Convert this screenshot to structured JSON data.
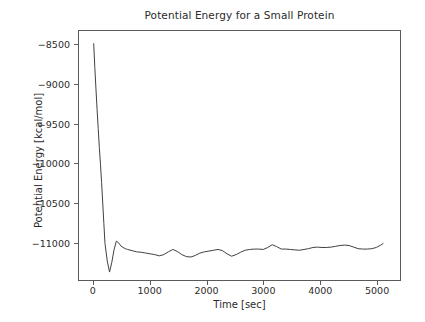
{
  "chart_data": {
    "type": "line",
    "title": "Potential Energy for a Small Protein",
    "xlabel": "Time [sec]",
    "ylabel": "Potential Energy [kcal/mol]",
    "xlim": [
      -260,
      5420
    ],
    "ylim": [
      -11470,
      -8330
    ],
    "xticks": [
      0,
      1000,
      2000,
      3000,
      4000,
      5000
    ],
    "xtick_labels": [
      "0",
      "1000",
      "2000",
      "3000",
      "4000",
      "5000"
    ],
    "yticks": [
      -8500,
      -9000,
      -9500,
      -10000,
      -10500,
      -11000
    ],
    "ytick_labels": [
      "−8500",
      "−9000",
      "−9500",
      "−10000",
      "−10500",
      "−11000"
    ],
    "grid": false,
    "legend": null,
    "line_color": "#404040",
    "line_width": 1.0,
    "series": [
      {
        "name": "Potential Energy",
        "x": [
          0,
          20,
          40,
          60,
          80,
          100,
          120,
          140,
          160,
          180,
          200,
          240,
          280,
          320,
          360,
          400,
          440,
          480,
          520,
          560,
          600,
          680,
          760,
          840,
          920,
          1000,
          1080,
          1160,
          1240,
          1320,
          1400,
          1480,
          1560,
          1640,
          1720,
          1800,
          1880,
          1960,
          2040,
          2120,
          2200,
          2280,
          2360,
          2440,
          2520,
          2600,
          2680,
          2760,
          2840,
          2920,
          3000,
          3080,
          3160,
          3240,
          3320,
          3400,
          3480,
          3560,
          3640,
          3720,
          3800,
          3880,
          3960,
          4040,
          4120,
          4200,
          4280,
          4360,
          4440,
          4520,
          4600,
          4680,
          4760,
          4840,
          4920,
          5000,
          5080,
          5120
        ],
        "y": [
          -8490,
          -8790,
          -9060,
          -9320,
          -9560,
          -9800,
          -10010,
          -10240,
          -10500,
          -10760,
          -11010,
          -11230,
          -11370,
          -11250,
          -11090,
          -10980,
          -11000,
          -11040,
          -11060,
          -11075,
          -11085,
          -11100,
          -11115,
          -11120,
          -11130,
          -11140,
          -11150,
          -11165,
          -11150,
          -11115,
          -11085,
          -11110,
          -11150,
          -11175,
          -11180,
          -11160,
          -11130,
          -11115,
          -11105,
          -11095,
          -11085,
          -11100,
          -11140,
          -11170,
          -11150,
          -11120,
          -11095,
          -11085,
          -11080,
          -11080,
          -11085,
          -11060,
          -11025,
          -11050,
          -11080,
          -11080,
          -11085,
          -11090,
          -11095,
          -11085,
          -11075,
          -11060,
          -11055,
          -11060,
          -11060,
          -11055,
          -11045,
          -11035,
          -11030,
          -11035,
          -11055,
          -11075,
          -11080,
          -11080,
          -11075,
          -11060,
          -11030,
          -11010
        ]
      }
    ]
  }
}
